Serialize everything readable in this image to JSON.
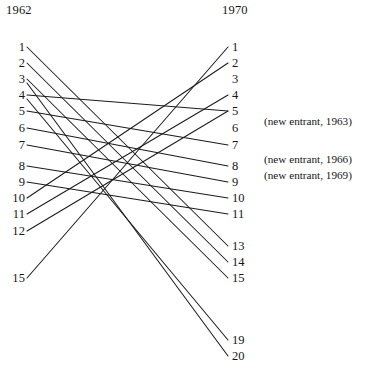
{
  "figure": {
    "type": "slopegraph",
    "title_left": "1962",
    "title_right": "1970"
  },
  "columns": {
    "left": {
      "header": "1962",
      "header_x": 6,
      "header_y": 3,
      "label_x": 25,
      "node_x": 27,
      "ranks": [
        {
          "label": "1",
          "y": 47
        },
        {
          "label": "2",
          "y": 63
        },
        {
          "label": "3",
          "y": 79
        },
        {
          "label": "4",
          "y": 95
        },
        {
          "label": "5",
          "y": 111
        },
        {
          "label": "6",
          "y": 128
        },
        {
          "label": "7",
          "y": 145
        },
        {
          "label": "8",
          "y": 166
        },
        {
          "label": "9",
          "y": 182
        },
        {
          "label": "10",
          "y": 198
        },
        {
          "label": "11",
          "y": 214
        },
        {
          "label": "12",
          "y": 231
        },
        {
          "label": "15",
          "y": 278
        }
      ]
    },
    "right": {
      "header": "1970",
      "header_x": 222,
      "header_y": 3,
      "label_x": 232,
      "node_x": 228,
      "ranks": [
        {
          "label": "1",
          "y": 47
        },
        {
          "label": "2",
          "y": 63
        },
        {
          "label": "3",
          "y": 79
        },
        {
          "label": "4",
          "y": 95
        },
        {
          "label": "5",
          "y": 111
        },
        {
          "label": "6",
          "y": 128
        },
        {
          "label": "7",
          "y": 145
        },
        {
          "label": "8",
          "y": 166
        },
        {
          "label": "9",
          "y": 182
        },
        {
          "label": "10",
          "y": 198
        },
        {
          "label": "11",
          "y": 214
        },
        {
          "label": "13",
          "y": 246
        },
        {
          "label": "14",
          "y": 262
        },
        {
          "label": "15",
          "y": 278
        },
        {
          "label": "19",
          "y": 340
        },
        {
          "label": "20",
          "y": 356
        }
      ]
    }
  },
  "annotations": [
    {
      "text": "(new entrant, 1963)",
      "y": 122
    },
    {
      "text": "(new entrant, 1966)",
      "y": 160
    },
    {
      "text": "(new entrant, 1969)",
      "y": 176
    }
  ],
  "chart_data": {
    "type": "line",
    "title": "",
    "xlabel": "",
    "ylabel": "",
    "categories": [
      "1962",
      "1970"
    ],
    "x": [
      27,
      228
    ],
    "legend": "none",
    "grid": false,
    "series": [
      {
        "name": "15 → 1",
        "values": [
          15,
          1
        ],
        "x1": 27,
        "y1": 278,
        "x2": 228,
        "y2": 47
      },
      {
        "name": "10 → 2",
        "values": [
          10,
          2
        ],
        "x1": 27,
        "y1": 198,
        "x2": 228,
        "y2": 63
      },
      {
        "name": "11 → 4",
        "values": [
          11,
          4
        ],
        "x1": 27,
        "y1": 214,
        "x2": 228,
        "y2": 95
      },
      {
        "name": "4 → 5",
        "values": [
          4,
          5
        ],
        "x1": 27,
        "y1": 95,
        "x2": 228,
        "y2": 111
      },
      {
        "name": "12 → 5b",
        "values": [
          12,
          5
        ],
        "x1": 27,
        "y1": 231,
        "x2": 228,
        "y2": 111
      },
      {
        "name": "5 → 7",
        "values": [
          5,
          7
        ],
        "x1": 27,
        "y1": 111,
        "x2": 228,
        "y2": 145
      },
      {
        "name": "6 → 8",
        "values": [
          6,
          8
        ],
        "x1": 27,
        "y1": 128,
        "x2": 228,
        "y2": 166
      },
      {
        "name": "7 → 9",
        "values": [
          7,
          9
        ],
        "x1": 27,
        "y1": 145,
        "x2": 228,
        "y2": 182
      },
      {
        "name": "8 → 10",
        "values": [
          8,
          10
        ],
        "x1": 27,
        "y1": 166,
        "x2": 228,
        "y2": 198
      },
      {
        "name": "9 → 11",
        "values": [
          9,
          11
        ],
        "x1": 27,
        "y1": 182,
        "x2": 228,
        "y2": 214
      },
      {
        "name": "1 → 13",
        "values": [
          1,
          13
        ],
        "x1": 27,
        "y1": 47,
        "x2": 228,
        "y2": 246
      },
      {
        "name": "2 → 14",
        "values": [
          2,
          14
        ],
        "x1": 27,
        "y1": 63,
        "x2": 228,
        "y2": 262
      },
      {
        "name": "3 → 15",
        "values": [
          3,
          15
        ],
        "x1": 27,
        "y1": 79,
        "x2": 228,
        "y2": 278
      },
      {
        "name": "4b → 19",
        "values": [
          4,
          19
        ],
        "x1": 27,
        "y1": 99,
        "x2": 228,
        "y2": 340
      },
      {
        "name": "3b → 20",
        "values": [
          3,
          20
        ],
        "x1": 27,
        "y1": 83,
        "x2": 228,
        "y2": 356
      }
    ]
  }
}
